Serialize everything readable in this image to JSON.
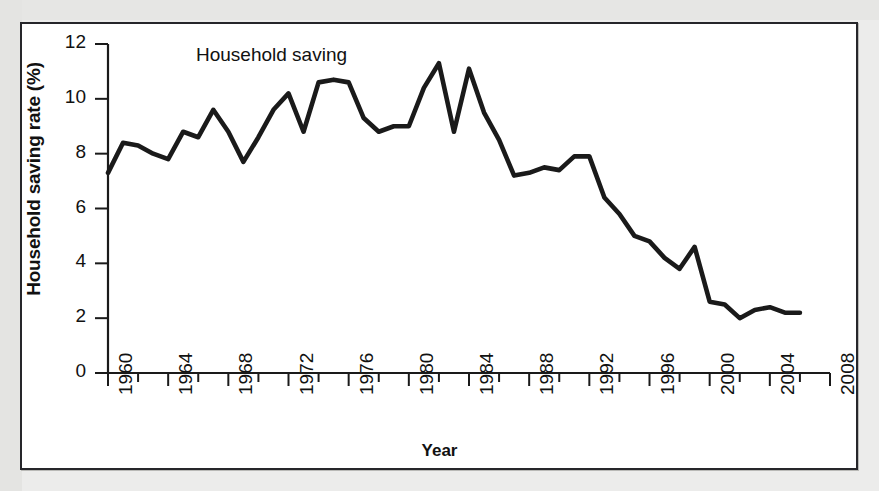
{
  "figure": {
    "background_color": "#ececeb",
    "panel_color": "#ffffff",
    "border_color": "#26262a",
    "line_color": "#1a1a1a"
  },
  "chart_data": {
    "type": "line",
    "title": "",
    "series_label": "Household saving",
    "xlabel": "Year",
    "ylabel": "Household saving rate (%)",
    "xlim": [
      1960,
      2008
    ],
    "ylim": [
      0,
      12
    ],
    "grid": false,
    "legend_position": "inline-annotation",
    "ytick_labels": [
      "0",
      "2",
      "4",
      "6",
      "8",
      "10",
      "12"
    ],
    "ytick_values": [
      0,
      2,
      4,
      6,
      8,
      10,
      12
    ],
    "xtick_labels": [
      "1960",
      "1964",
      "1968",
      "1972",
      "1976",
      "1980",
      "1984",
      "1988",
      "1992",
      "1996",
      "2000",
      "2004",
      "2008"
    ],
    "xtick_values": [
      1960,
      1964,
      1968,
      1972,
      1976,
      1980,
      1984,
      1988,
      1992,
      1996,
      2000,
      2004,
      2008
    ],
    "xminor_tick_values": [
      1962,
      1966,
      1970,
      1974,
      1978,
      1982,
      1986,
      1990,
      1994,
      1998,
      2002,
      2006
    ],
    "series": [
      {
        "name": "Household saving",
        "x": [
          1960,
          1961,
          1962,
          1963,
          1964,
          1965,
          1966,
          1967,
          1968,
          1969,
          1970,
          1971,
          1972,
          1973,
          1974,
          1975,
          1976,
          1977,
          1978,
          1979,
          1980,
          1981,
          1982,
          1983,
          1984,
          1985,
          1986,
          1987,
          1988,
          1989,
          1990,
          1991,
          1992,
          1993,
          1994,
          1995,
          1996,
          1997,
          1998,
          1999,
          2000,
          2001,
          2002,
          2003,
          2004,
          2005,
          2006
        ],
        "values": [
          7.3,
          8.4,
          8.3,
          8.0,
          7.8,
          8.8,
          8.6,
          9.6,
          8.8,
          7.7,
          8.6,
          9.6,
          10.2,
          8.8,
          10.6,
          10.7,
          10.6,
          9.3,
          8.8,
          9.0,
          9.0,
          10.4,
          11.3,
          8.8,
          11.1,
          9.5,
          8.5,
          7.2,
          7.3,
          7.5,
          7.4,
          7.9,
          7.9,
          6.4,
          5.8,
          5.0,
          4.8,
          4.2,
          3.8,
          4.6,
          2.6,
          2.5,
          2.0,
          2.3,
          2.4,
          2.2,
          2.2
        ]
      }
    ]
  }
}
